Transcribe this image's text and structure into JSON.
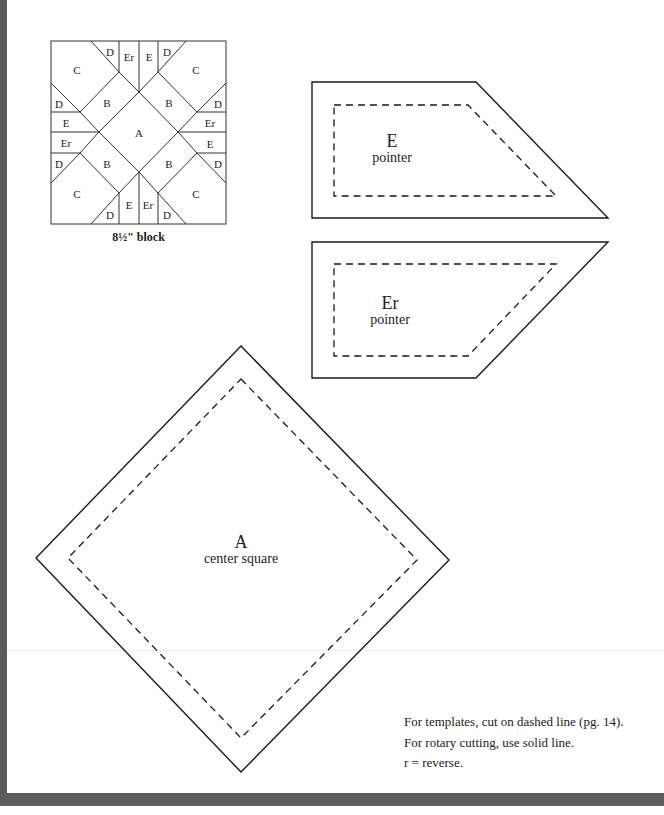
{
  "block_diagram": {
    "caption": "8½\" block",
    "pieces": {
      "center": "A",
      "b": "B",
      "c": "C",
      "d": "D",
      "e": "E",
      "er": "Er"
    }
  },
  "templates": [
    {
      "id": "E",
      "letter": "E",
      "name": "pointer"
    },
    {
      "id": "Er",
      "letter": "Er",
      "name": "pointer"
    },
    {
      "id": "A",
      "letter": "A",
      "name": "center square"
    }
  ],
  "notes": [
    "For templates, cut on dashed line (pg. 14).",
    "For rotary cutting, use solid line.",
    "r = reverse."
  ],
  "colors": {
    "line": "#1a1a1a",
    "border": "#5a5a5a",
    "background": "#ffffff"
  }
}
